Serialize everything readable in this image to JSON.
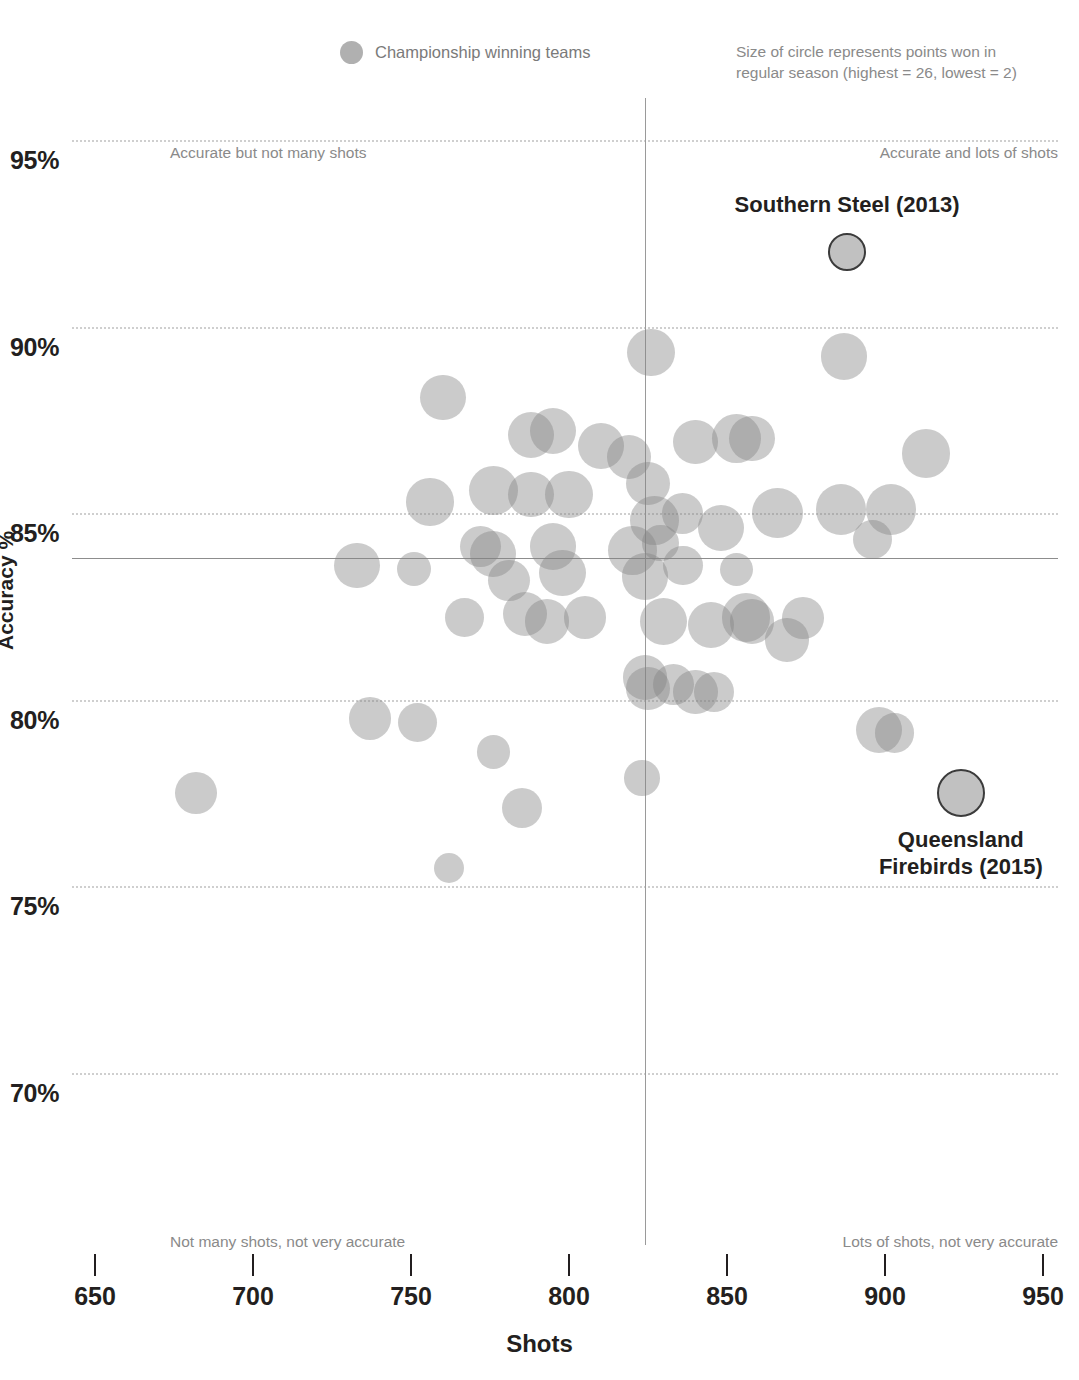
{
  "legend": {
    "swatch_name": "bubble-swatch",
    "label": "Championship winning teams"
  },
  "size_note": "Size of circle represents points won in regular season (highest = 26, lowest = 2)",
  "axis_titles": {
    "x": "Shots",
    "y": "Accuracy %"
  },
  "quadrant_notes": {
    "top_left": "Accurate but not many shots",
    "top_right": "Accurate and lots of shots",
    "bottom_left": "Not many shots, not very accurate",
    "bottom_right": "Lots of shots, not very accurate"
  },
  "annotations": [
    {
      "label": "Southern Steel (2013)",
      "x": 888,
      "y": 92.0
    },
    {
      "label": "Queensland Firebirds (2015)",
      "x": 924,
      "y": 77.5
    }
  ],
  "chart_data": {
    "type": "scatter",
    "title": "",
    "subtitle": "",
    "xlabel": "Shots",
    "ylabel": "Accuracy %",
    "xlim": [
      650,
      950
    ],
    "ylim": [
      68.2,
      95.8
    ],
    "xticks": [
      650,
      700,
      750,
      800,
      850,
      900,
      950
    ],
    "yticks": [
      70,
      75,
      80,
      85,
      90,
      95
    ],
    "ytick_labels": [
      "70%",
      "75%",
      "80%",
      "85%",
      "90%",
      "95%"
    ],
    "grid": "horizontal-dotted",
    "legend_position": "top-center",
    "size_encoding": {
      "variable": "points won in regular season",
      "max": 26,
      "min": 2
    },
    "reference_lines": {
      "mean_accuracy": 83.8,
      "mean_shots": 824
    },
    "bubble_color": "#828282",
    "bubble_opacity": 0.42,
    "highlight_fill": "#c1c1c1",
    "highlight_stroke": "#3b3b3b",
    "series": [
      {
        "name": "Teams (season)",
        "points": [
          {
            "x": 826,
            "y": 89.3,
            "size": 22
          },
          {
            "x": 887,
            "y": 89.2,
            "size": 21
          },
          {
            "x": 760,
            "y": 88.1,
            "size": 20
          },
          {
            "x": 788,
            "y": 87.1,
            "size": 21
          },
          {
            "x": 795,
            "y": 87.2,
            "size": 21
          },
          {
            "x": 810,
            "y": 86.8,
            "size": 20
          },
          {
            "x": 819,
            "y": 86.5,
            "size": 18
          },
          {
            "x": 840,
            "y": 86.9,
            "size": 18
          },
          {
            "x": 853,
            "y": 87.0,
            "size": 24
          },
          {
            "x": 858,
            "y": 87.0,
            "size": 20
          },
          {
            "x": 913,
            "y": 86.6,
            "size": 24
          },
          {
            "x": 776,
            "y": 85.6,
            "size": 24
          },
          {
            "x": 788,
            "y": 85.5,
            "size": 20
          },
          {
            "x": 800,
            "y": 85.5,
            "size": 22
          },
          {
            "x": 756,
            "y": 85.3,
            "size": 22
          },
          {
            "x": 825,
            "y": 85.8,
            "size": 17
          },
          {
            "x": 827,
            "y": 84.8,
            "size": 24
          },
          {
            "x": 836,
            "y": 85.0,
            "size": 14
          },
          {
            "x": 848,
            "y": 84.6,
            "size": 20
          },
          {
            "x": 866,
            "y": 85.0,
            "size": 26
          },
          {
            "x": 886,
            "y": 85.1,
            "size": 26
          },
          {
            "x": 902,
            "y": 85.1,
            "size": 26
          },
          {
            "x": 896,
            "y": 84.3,
            "size": 12
          },
          {
            "x": 772,
            "y": 84.1,
            "size": 14
          },
          {
            "x": 776,
            "y": 83.9,
            "size": 20
          },
          {
            "x": 795,
            "y": 84.1,
            "size": 21
          },
          {
            "x": 820,
            "y": 84.0,
            "size": 24
          },
          {
            "x": 829,
            "y": 84.2,
            "size": 10
          },
          {
            "x": 733,
            "y": 83.6,
            "size": 20
          },
          {
            "x": 751,
            "y": 83.5,
            "size": 8
          },
          {
            "x": 781,
            "y": 83.2,
            "size": 15
          },
          {
            "x": 798,
            "y": 83.4,
            "size": 21
          },
          {
            "x": 824,
            "y": 83.3,
            "size": 21
          },
          {
            "x": 836,
            "y": 83.6,
            "size": 13
          },
          {
            "x": 853,
            "y": 83.5,
            "size": 7
          },
          {
            "x": 767,
            "y": 82.2,
            "size": 12
          },
          {
            "x": 786,
            "y": 82.3,
            "size": 18
          },
          {
            "x": 793,
            "y": 82.1,
            "size": 18
          },
          {
            "x": 805,
            "y": 82.2,
            "size": 16
          },
          {
            "x": 830,
            "y": 82.1,
            "size": 22
          },
          {
            "x": 845,
            "y": 82.0,
            "size": 20
          },
          {
            "x": 856,
            "y": 82.2,
            "size": 24
          },
          {
            "x": 858,
            "y": 82.1,
            "size": 18
          },
          {
            "x": 874,
            "y": 82.2,
            "size": 15
          },
          {
            "x": 869,
            "y": 81.6,
            "size": 17
          },
          {
            "x": 824,
            "y": 80.6,
            "size": 18
          },
          {
            "x": 825,
            "y": 80.3,
            "size": 17
          },
          {
            "x": 833,
            "y": 80.4,
            "size": 14
          },
          {
            "x": 840,
            "y": 80.2,
            "size": 18
          },
          {
            "x": 846,
            "y": 80.2,
            "size": 13
          },
          {
            "x": 737,
            "y": 79.5,
            "size": 16
          },
          {
            "x": 752,
            "y": 79.4,
            "size": 12
          },
          {
            "x": 898,
            "y": 79.2,
            "size": 20
          },
          {
            "x": 903,
            "y": 79.1,
            "size": 13
          },
          {
            "x": 776,
            "y": 78.6,
            "size": 7
          },
          {
            "x": 823,
            "y": 77.9,
            "size": 9
          },
          {
            "x": 682,
            "y": 77.5,
            "size": 15
          },
          {
            "x": 785,
            "y": 77.1,
            "size": 13
          },
          {
            "x": 762,
            "y": 75.5,
            "size": 5
          }
        ]
      }
    ]
  }
}
